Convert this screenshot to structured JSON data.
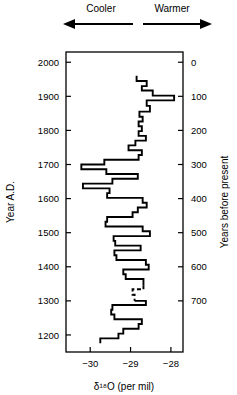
{
  "header": {
    "cooler_label": "Cooler",
    "warmer_label": "Warmer",
    "cooler_arrow_icon": "arrow-left-icon",
    "warmer_arrow_icon": "arrow-right-icon"
  },
  "chart_data": {
    "type": "line",
    "title": "",
    "xlabel": "δ¹⁸O (per mil)",
    "ylabel": "Year A.D.",
    "ylabel_right": "Years before present",
    "xlim": [
      -30.6,
      -27.7
    ],
    "ylim": [
      1150,
      2030
    ],
    "ylim_right": [
      -30,
      850
    ],
    "xticks": [
      -30,
      -29,
      -28
    ],
    "xticklabels": [
      "−30",
      "−29",
      "−28"
    ],
    "yticks": [
      2000,
      1900,
      1800,
      1700,
      1600,
      1500,
      1400,
      1300,
      1200
    ],
    "yticklabels": [
      "2000",
      "1900",
      "1800",
      "1700",
      "1600",
      "1500",
      "1400",
      "1300",
      "1200"
    ],
    "yticks_right": [
      0,
      100,
      200,
      300,
      400,
      500,
      600,
      700
    ],
    "yticklabels_right": [
      "0",
      "100",
      "200",
      "300",
      "400",
      "500",
      "600",
      "700"
    ],
    "grid": false,
    "legend": false,
    "step_style": "horizontal-steps",
    "annotations": [
      {
        "kind": "direction-arrow",
        "text": "Cooler",
        "points": "left"
      },
      {
        "kind": "direction-arrow",
        "text": "Warmer",
        "points": "right"
      },
      {
        "kind": "dashed-segment",
        "note": "interpolated data",
        "year_range": [
          1290,
          1330
        ]
      }
    ],
    "series": [
      {
        "name": "δ18O ice core record",
        "linestyle": "solid",
        "points": [
          {
            "year": 1960,
            "d18o": -28.85
          },
          {
            "year": 1945,
            "d18o": -28.85
          },
          {
            "year": 1945,
            "d18o": -28.6
          },
          {
            "year": 1930,
            "d18o": -28.6
          },
          {
            "year": 1930,
            "d18o": -28.72
          },
          {
            "year": 1917,
            "d18o": -28.72
          },
          {
            "year": 1917,
            "d18o": -28.45
          },
          {
            "year": 1902,
            "d18o": -28.45
          },
          {
            "year": 1902,
            "d18o": -27.92
          },
          {
            "year": 1888,
            "d18o": -27.92
          },
          {
            "year": 1888,
            "d18o": -28.6
          },
          {
            "year": 1872,
            "d18o": -28.6
          },
          {
            "year": 1872,
            "d18o": -28.52
          },
          {
            "year": 1855,
            "d18o": -28.52
          },
          {
            "year": 1855,
            "d18o": -28.78
          },
          {
            "year": 1840,
            "d18o": -28.78
          },
          {
            "year": 1840,
            "d18o": -28.7
          },
          {
            "year": 1826,
            "d18o": -28.7
          },
          {
            "year": 1826,
            "d18o": -28.8
          },
          {
            "year": 1812,
            "d18o": -28.8
          },
          {
            "year": 1812,
            "d18o": -28.72
          },
          {
            "year": 1798,
            "d18o": -28.72
          },
          {
            "year": 1798,
            "d18o": -28.8
          },
          {
            "year": 1784,
            "d18o": -28.8
          },
          {
            "year": 1784,
            "d18o": -28.62
          },
          {
            "year": 1770,
            "d18o": -28.62
          },
          {
            "year": 1770,
            "d18o": -28.88
          },
          {
            "year": 1756,
            "d18o": -28.88
          },
          {
            "year": 1756,
            "d18o": -29.05
          },
          {
            "year": 1742,
            "d18o": -29.05
          },
          {
            "year": 1742,
            "d18o": -28.72
          },
          {
            "year": 1728,
            "d18o": -28.72
          },
          {
            "year": 1728,
            "d18o": -28.8
          },
          {
            "year": 1714,
            "d18o": -28.8
          },
          {
            "year": 1714,
            "d18o": -29.65
          },
          {
            "year": 1700,
            "d18o": -29.65
          },
          {
            "year": 1700,
            "d18o": -30.22
          },
          {
            "year": 1686,
            "d18o": -30.22
          },
          {
            "year": 1686,
            "d18o": -29.6
          },
          {
            "year": 1672,
            "d18o": -29.6
          },
          {
            "year": 1672,
            "d18o": -28.82
          },
          {
            "year": 1658,
            "d18o": -28.82
          },
          {
            "year": 1658,
            "d18o": -29.45
          },
          {
            "year": 1644,
            "d18o": -29.45
          },
          {
            "year": 1644,
            "d18o": -30.18
          },
          {
            "year": 1630,
            "d18o": -30.18
          },
          {
            "year": 1630,
            "d18o": -29.52
          },
          {
            "year": 1616,
            "d18o": -29.52
          },
          {
            "year": 1616,
            "d18o": -29.58
          },
          {
            "year": 1602,
            "d18o": -29.58
          },
          {
            "year": 1602,
            "d18o": -28.7
          },
          {
            "year": 1588,
            "d18o": -28.7
          },
          {
            "year": 1588,
            "d18o": -28.6
          },
          {
            "year": 1574,
            "d18o": -28.6
          },
          {
            "year": 1574,
            "d18o": -28.82
          },
          {
            "year": 1560,
            "d18o": -28.82
          },
          {
            "year": 1560,
            "d18o": -28.95
          },
          {
            "year": 1546,
            "d18o": -28.95
          },
          {
            "year": 1546,
            "d18o": -29.58
          },
          {
            "year": 1532,
            "d18o": -29.58
          },
          {
            "year": 1532,
            "d18o": -29.62
          },
          {
            "year": 1518,
            "d18o": -29.62
          },
          {
            "year": 1518,
            "d18o": -28.7
          },
          {
            "year": 1504,
            "d18o": -28.7
          },
          {
            "year": 1504,
            "d18o": -28.52
          },
          {
            "year": 1490,
            "d18o": -28.52
          },
          {
            "year": 1490,
            "d18o": -29.42
          },
          {
            "year": 1476,
            "d18o": -29.42
          },
          {
            "year": 1476,
            "d18o": -29.38
          },
          {
            "year": 1462,
            "d18o": -29.38
          },
          {
            "year": 1462,
            "d18o": -28.75
          },
          {
            "year": 1448,
            "d18o": -28.75
          },
          {
            "year": 1448,
            "d18o": -29.4
          },
          {
            "year": 1434,
            "d18o": -29.4
          },
          {
            "year": 1434,
            "d18o": -29.35
          },
          {
            "year": 1420,
            "d18o": -29.35
          },
          {
            "year": 1420,
            "d18o": -28.62
          },
          {
            "year": 1406,
            "d18o": -28.62
          },
          {
            "year": 1406,
            "d18o": -28.55
          },
          {
            "year": 1392,
            "d18o": -28.55
          },
          {
            "year": 1392,
            "d18o": -29.18
          },
          {
            "year": 1378,
            "d18o": -29.18
          },
          {
            "year": 1378,
            "d18o": -29.12
          },
          {
            "year": 1364,
            "d18o": -29.12
          },
          {
            "year": 1364,
            "d18o": -28.68
          },
          {
            "year": 1346,
            "d18o": -28.68
          }
        ]
      },
      {
        "name": "δ18O interpolated",
        "linestyle": "dashed",
        "points": [
          {
            "year": 1346,
            "d18o": -28.68
          },
          {
            "year": 1334,
            "d18o": -28.68
          },
          {
            "year": 1334,
            "d18o": -28.95
          },
          {
            "year": 1318,
            "d18o": -28.95
          },
          {
            "year": 1318,
            "d18o": -28.9
          },
          {
            "year": 1300,
            "d18o": -28.9
          }
        ]
      },
      {
        "name": "δ18O ice core record (lower)",
        "linestyle": "solid",
        "points": [
          {
            "year": 1300,
            "d18o": -28.9
          },
          {
            "year": 1300,
            "d18o": -28.62
          },
          {
            "year": 1288,
            "d18o": -28.62
          },
          {
            "year": 1288,
            "d18o": -29.45
          },
          {
            "year": 1274,
            "d18o": -29.45
          },
          {
            "year": 1274,
            "d18o": -29.48
          },
          {
            "year": 1260,
            "d18o": -29.48
          },
          {
            "year": 1260,
            "d18o": -29.4
          },
          {
            "year": 1246,
            "d18o": -29.4
          },
          {
            "year": 1246,
            "d18o": -28.72
          },
          {
            "year": 1232,
            "d18o": -28.72
          },
          {
            "year": 1232,
            "d18o": -28.8
          },
          {
            "year": 1218,
            "d18o": -28.8
          },
          {
            "year": 1218,
            "d18o": -29.18
          },
          {
            "year": 1204,
            "d18o": -29.18
          },
          {
            "year": 1204,
            "d18o": -29.3
          },
          {
            "year": 1190,
            "d18o": -29.3
          },
          {
            "year": 1190,
            "d18o": -29.75
          },
          {
            "year": 1176,
            "d18o": -29.75
          }
        ]
      }
    ]
  }
}
